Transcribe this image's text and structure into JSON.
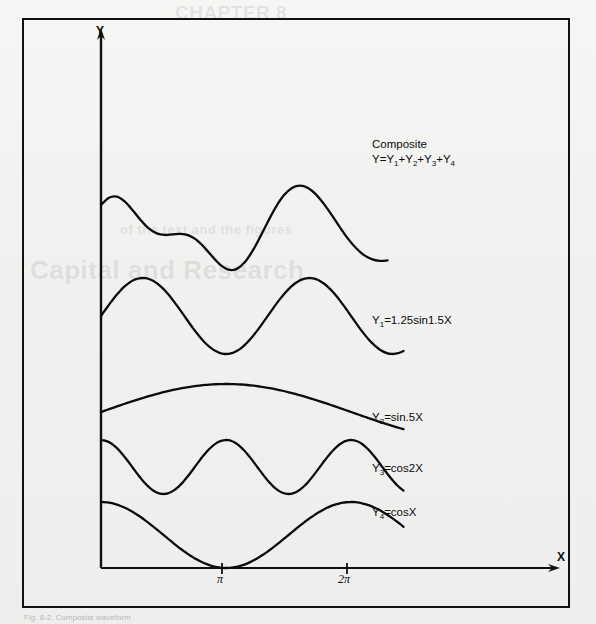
{
  "page": {
    "background_color": "#f2f2f1",
    "frame_color": "#111111",
    "ink_color": "#0c0c0c"
  },
  "ghost_showthrough": {
    "title": "CHAPTER 8",
    "heading": "Capital and Research",
    "line": "of the text and the figures"
  },
  "caption": "Fig. 8-2. Composite waveform",
  "axes": {
    "y_label": "Y",
    "x_label": "X",
    "ticks": [
      {
        "label": "π",
        "x_value": 3.14159
      },
      {
        "label": "2π",
        "x_value": 6.28318
      }
    ]
  },
  "labels": {
    "composite_line1": "Composite",
    "composite_line2_prefix": "Y=Y",
    "y1": "=1.25sin1.5X",
    "y2": "=sin.5X",
    "y3": "=cos2X",
    "y4": "=cosX",
    "y_letter": "Y",
    "sub1": "1",
    "sub2": "2",
    "sub3": "3",
    "sub4": "4",
    "plus": "+"
  },
  "chart_data": {
    "type": "line",
    "xlabel": "X",
    "ylabel": "Y",
    "xlim": [
      0,
      7.6
    ],
    "grid": false,
    "legend": "inline-right",
    "x_tick_values": [
      3.14159,
      6.28318
    ],
    "x_tick_labels": [
      "π",
      "2π"
    ],
    "series": [
      {
        "name": "Composite",
        "formula": "Y=Y1+Y2+Y3+Y4",
        "label": "Composite  Y=Y₁+Y₂+Y₃+Y₄",
        "baseline_px": 248,
        "amplitude_px": 46,
        "x": [
          0,
          0.2,
          0.4,
          0.6,
          0.8,
          1.0,
          1.2,
          1.4,
          1.6,
          1.8,
          2.0,
          2.2,
          2.4,
          2.6,
          2.8,
          3.0,
          3.2,
          3.4,
          3.6,
          3.8,
          4.0,
          4.2,
          4.4,
          4.6,
          4.8,
          5.0,
          5.2,
          5.4,
          5.6,
          5.8,
          6.0,
          6.2,
          6.4,
          6.6,
          6.8,
          7.0,
          7.2
        ],
        "y": [
          2.25,
          2.62,
          2.68,
          2.42,
          1.96,
          1.45,
          1.02,
          0.76,
          0.68,
          0.71,
          0.74,
          0.66,
          0.42,
          0.02,
          -0.45,
          -0.88,
          -1.13,
          -1.1,
          -0.77,
          -0.18,
          0.58,
          1.4,
          2.16,
          2.76,
          3.13,
          3.25,
          3.13,
          2.8,
          2.3,
          1.71,
          1.09,
          0.5,
          0.01,
          -0.36,
          -0.58,
          -0.67,
          -0.65
        ]
      },
      {
        "name": "Y1",
        "formula": "Y1=1.25sin1.5X",
        "label": "Y₁=1.25sin1.5X",
        "amplitude": 1.25,
        "frequency": 1.5,
        "phase": 0,
        "wave": "sin",
        "baseline_px": 316,
        "amplitude_px": 38
      },
      {
        "name": "Y2",
        "formula": "Y2=sin.5X",
        "label": "Y₂=sin.5X",
        "amplitude": 1.0,
        "frequency": 0.5,
        "phase": 0,
        "wave": "sin",
        "baseline_px": 412,
        "amplitude_px": 28
      },
      {
        "name": "Y3",
        "formula": "Y3=cos2X",
        "label": "Y₃=cos2X",
        "amplitude": 1.0,
        "frequency": 2.0,
        "phase": 0,
        "wave": "cos",
        "baseline_px": 467,
        "amplitude_px": 27
      },
      {
        "name": "Y4",
        "formula": "Y4=cosX",
        "label": "Y₄=cosX",
        "amplitude": 1.0,
        "frequency": 1.0,
        "phase": 0,
        "wave": "cos",
        "baseline_px": 535,
        "amplitude_px": 33
      }
    ]
  },
  "geometry": {
    "origin_x": 101,
    "origin_y": 568,
    "x_axis_end": 556,
    "y_axis_top": 32,
    "x_scale_px_per_unit": 39.8
  }
}
